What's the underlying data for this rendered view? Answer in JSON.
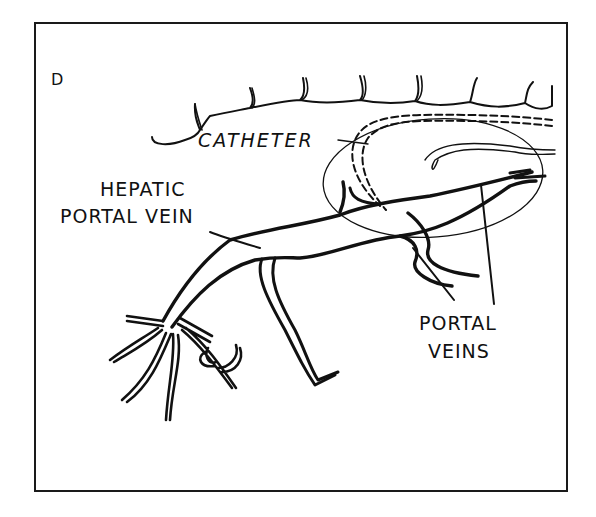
{
  "figure": {
    "panel_label": "D",
    "labels": {
      "catheter": "CATHETER",
      "hepatic_portal_vein_line1": "HEPATIC",
      "hepatic_portal_vein_line2": "PORTAL VEIN",
      "portal_veins_line1": "PORTAL",
      "portal_veins_line2": "VEINS"
    },
    "colors": {
      "ink": "#111111",
      "background": "#ffffff"
    }
  }
}
